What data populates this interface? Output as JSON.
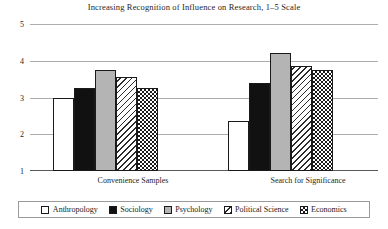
{
  "chart_data": {
    "type": "bar",
    "title": "Increasing Recognition of Influence on Research, 1–5 Scale",
    "xlabel": "",
    "ylabel": "",
    "categories": [
      "Convenience Samples",
      "Search for Significance"
    ],
    "series": [
      {
        "name": "Anthropology",
        "values": [
          3.0,
          2.35
        ],
        "pattern": "dotted"
      },
      {
        "name": "Sociology",
        "values": [
          3.25,
          3.4
        ],
        "pattern": "solid-black"
      },
      {
        "name": "Psychology",
        "values": [
          3.75,
          4.2
        ],
        "pattern": "gray"
      },
      {
        "name": "Political Science",
        "values": [
          3.55,
          3.85
        ],
        "pattern": "diagonal-hatch"
      },
      {
        "name": "Economics",
        "values": [
          3.25,
          3.75
        ],
        "pattern": "checkerboard"
      }
    ],
    "ylim": [
      1,
      5
    ],
    "yticks": [
      "1",
      "2",
      "3",
      "4",
      "5"
    ],
    "grid": true,
    "legend_position": "bottom"
  },
  "axis": {
    "tick_5": "5",
    "tick_4": "4",
    "tick_3": "3",
    "tick_2": "2",
    "tick_1": "1"
  },
  "categories": {
    "group_1": "Convenience Samples",
    "group_2": "Search for Significance"
  },
  "legend": {
    "items": [
      {
        "label": "Anthropology"
      },
      {
        "label": "Sociology"
      },
      {
        "label": "Psychology"
      },
      {
        "label": "Political Science"
      },
      {
        "label": "Economics"
      }
    ]
  },
  "colors": {
    "gridline": "#adadad",
    "axis": "#5a5a5a",
    "text": "#262626",
    "bar_black": "#111111",
    "bar_gray": "#b4b4b4",
    "bar_white": "#ffffff"
  }
}
